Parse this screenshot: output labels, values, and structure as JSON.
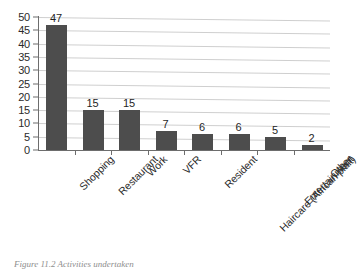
{
  "chart_data": {
    "type": "bar",
    "title": "",
    "xlabel": "",
    "ylabel": "",
    "ylim": [
      0,
      50
    ],
    "ytick_step": 5,
    "grid": true,
    "legend": false,
    "orientation": "vertical",
    "bar_color": "#4d4d4d",
    "gridline_color": "#cfcfcf",
    "axis_color": "#6d6d6d",
    "categories": [
      "Shopping",
      "Restaurant",
      "Work",
      "VFR",
      "Resident",
      "Haircare (African plait)",
      "Entertainment",
      "Other"
    ],
    "values": [
      47,
      15,
      15,
      7,
      6,
      6,
      5,
      2
    ],
    "value_labels": [
      "47",
      "15",
      "15",
      "7",
      "6",
      "6",
      "5",
      "2"
    ],
    "yticks": [
      "50",
      "45",
      "40",
      "35",
      "30",
      "25",
      "20",
      "15",
      "10",
      "5",
      "0"
    ],
    "ytick_values": [
      50,
      45,
      40,
      35,
      30,
      25,
      20,
      15,
      10,
      5,
      0
    ]
  },
  "caption": {
    "text": "Figure 11.2  Activities undertaken"
  }
}
